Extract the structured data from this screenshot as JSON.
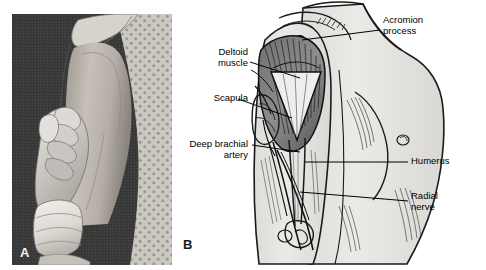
{
  "figure": {
    "type": "medical-anatomy-figure",
    "panels": [
      {
        "id": "A",
        "letter": "A",
        "kind": "photograph",
        "description": "Clinical photograph of a gloved hand palpating the lateral upper arm / deltoid region of a patient wearing a polka-dot hospital gown against a dark background"
      },
      {
        "id": "B",
        "letter": "B",
        "kind": "line-drawing",
        "description": "Anatomical line drawing of the lateral shoulder and upper arm showing the deltoid muscle, underlying bone and neurovascular structures"
      }
    ]
  },
  "labels": {
    "deltoid_muscle": "Deltoid\nmuscle",
    "scapula": "Scapula",
    "deep_brachial_artery": "Deep brachial\nartery",
    "acromion_process": "Acromion\nprocess",
    "humerus": "Humerus",
    "radial_nerve": "Radial\nnerve"
  },
  "colors": {
    "line": "#000000",
    "text": "#000000",
    "page_background": "#ffffff",
    "photo_background": "#3a3a3a",
    "skin_fill": "#e8e6e2",
    "muscle_fill": "#8d8d8d",
    "gown_fill": "#cfcdc8"
  }
}
